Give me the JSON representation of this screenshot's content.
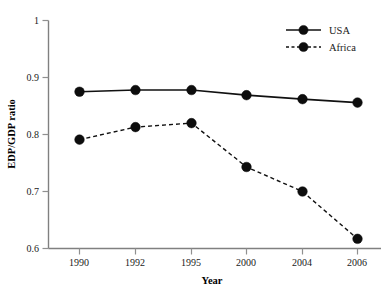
{
  "chart_data": {
    "type": "line",
    "title": "",
    "xlabel": "Year",
    "ylabel": "EDP/GDP ratio",
    "categories": [
      "1990",
      "1992",
      "1995",
      "2000",
      "2004",
      "2006"
    ],
    "series": [
      {
        "name": "USA",
        "style": "solid",
        "marker": "filled-circle",
        "color": "#111111",
        "values": [
          0.875,
          0.878,
          0.878,
          0.869,
          0.862,
          0.856
        ]
      },
      {
        "name": "Africa",
        "style": "dashed",
        "marker": "filled-circle",
        "color": "#111111",
        "values": [
          0.791,
          0.813,
          0.82,
          0.743,
          0.7,
          0.617
        ]
      }
    ],
    "ylim": [
      0.6,
      1.0
    ],
    "yticks": [
      0.6,
      0.7,
      0.8,
      0.9,
      1.0
    ],
    "ytick_labels": [
      "0.6",
      "0.7",
      "0.8",
      "0.9",
      "1"
    ],
    "grid": false,
    "legend_position": "top-right"
  },
  "legend": {
    "entries": [
      {
        "label": "USA"
      },
      {
        "label": "Africa"
      }
    ]
  },
  "axes": {
    "y_title": "EDP/GDP ratio",
    "x_title": "Year"
  }
}
